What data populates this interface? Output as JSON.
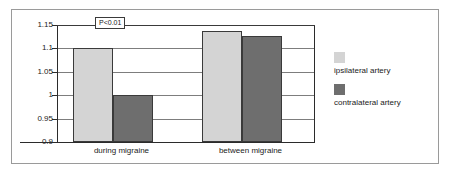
{
  "chart_data": {
    "type": "bar",
    "title": "",
    "xlabel": "",
    "ylabel": "",
    "categories": [
      "during migraine",
      "between migraine"
    ],
    "series": [
      {
        "name": "ipsilateral artery",
        "values": [
          1.1,
          1.138
        ],
        "color": "#d4d4d4"
      },
      {
        "name": "contralateral artery",
        "values": [
          1.0,
          1.126
        ],
        "color": "#6e6e6e"
      }
    ],
    "ylim": [
      0.9,
      1.15
    ],
    "yticks": [
      "0.9",
      "0.95",
      "1",
      "1.05",
      "1.1",
      "1.15"
    ],
    "ytick_values": [
      0.9,
      0.95,
      1.0,
      1.05,
      1.1,
      1.15
    ],
    "grid": true,
    "legend_position": "right",
    "annotations": [
      {
        "text": "P<0.01",
        "target": "during migraine",
        "level": 1.15
      }
    ]
  },
  "legend": {
    "entries": [
      {
        "label": "ipsilateral artery",
        "color": "#d4d4d4"
      },
      {
        "label": "contralateral artery",
        "color": "#6e6e6e"
      }
    ]
  },
  "annotation": {
    "p_value_label": "P<0.01"
  }
}
